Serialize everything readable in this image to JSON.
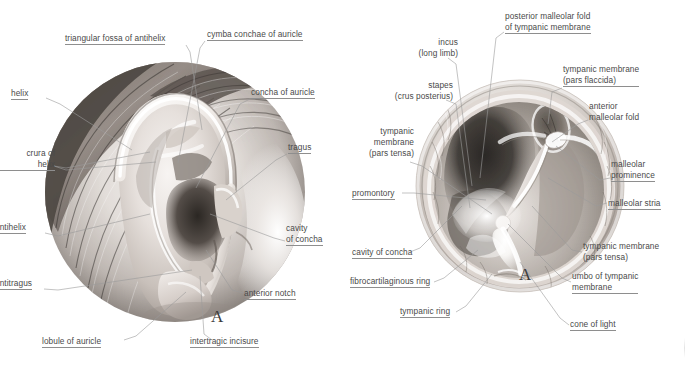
{
  "plate": {
    "background": "#ffffff",
    "label_color": "#4a4a4a",
    "leader_color": "#9a9a9a",
    "width": 688,
    "height": 367
  },
  "panel_a_left": {
    "letter": "A",
    "subject": "auricle-external-ear",
    "labels": [
      {
        "id": "triangular-fossa-of-antihelix",
        "lines": [
          "triangular fossa of antihelix"
        ],
        "x": 65,
        "y": 33,
        "align": "left"
      },
      {
        "id": "cymba-conchae-of-auricle",
        "lines": [
          "cymba conchae of auricle"
        ],
        "x": 207,
        "y": 29,
        "align": "left"
      },
      {
        "id": "helix",
        "lines": [
          "helix"
        ],
        "x": 11,
        "y": 88,
        "align": "left"
      },
      {
        "id": "concha-of-auricle",
        "lines": [
          "concha of auricle"
        ],
        "x": 251,
        "y": 87,
        "align": "left"
      },
      {
        "id": "crura-of-helix",
        "lines": [
          "crura of",
          "helix"
        ],
        "x": -3,
        "y": 148,
        "align": "right",
        "clipped": true
      },
      {
        "id": "tragus",
        "lines": [
          "tragus"
        ],
        "x": 288,
        "y": 142,
        "align": "left"
      },
      {
        "id": "antihelix",
        "lines": [
          "antihelix"
        ],
        "x": -5,
        "y": 222,
        "align": "left",
        "clipped": true
      },
      {
        "id": "cavity-of-concha",
        "lines": [
          "cavity",
          "of concha"
        ],
        "x": 286,
        "y": 223,
        "align": "left"
      },
      {
        "id": "antitragus",
        "lines": [
          "antitragus"
        ],
        "x": -5,
        "y": 278,
        "align": "left",
        "clipped": true
      },
      {
        "id": "anterior-notch",
        "lines": [
          "anterior notch"
        ],
        "x": 244,
        "y": 288,
        "align": "left"
      },
      {
        "id": "lobule-of-auricle",
        "lines": [
          "lobule of auricle"
        ],
        "x": 42,
        "y": 336,
        "align": "left"
      },
      {
        "id": "intertragic-incisure",
        "lines": [
          "intertragic incisure"
        ],
        "x": 190,
        "y": 336,
        "align": "left"
      }
    ]
  },
  "panel_a_right": {
    "letter": "A",
    "subject": "tympanic-membrane-otoscopic-view",
    "labels": [
      {
        "id": "posterior-malleolar-fold-of-tympanic-membrane",
        "lines": [
          "posterior malleolar fold",
          "of tympanic membrane"
        ],
        "x": 505,
        "y": 11,
        "align": "left"
      },
      {
        "id": "incus-long-limb",
        "lines": [
          "incus",
          "(long limb)"
        ],
        "x": 415,
        "y": 37,
        "align": "right"
      },
      {
        "id": "tympanic-membrane-pars-flaccida",
        "lines": [
          "tympanic membrane",
          "(pars flaccida)",
          "..."
        ],
        "x": 563,
        "y": 65,
        "align": "left"
      },
      {
        "id": "stapes-crus-posterius",
        "lines": [
          "stapes",
          "(crus posterius)"
        ],
        "x": 398,
        "y": 80,
        "align": "right"
      },
      {
        "id": "anterior-malleolar-fold",
        "lines": [
          "anterior",
          "malleolar fold"
        ],
        "x": 589,
        "y": 101,
        "align": "left"
      },
      {
        "id": "tympanic-membrane-pars-tensa-left",
        "lines": [
          "tympanic",
          "membrane",
          "(pars tensa)"
        ],
        "x": 356,
        "y": 131,
        "align": "right"
      },
      {
        "id": "malleolar-prominence",
        "lines": [
          "malleolar",
          "prominence"
        ],
        "x": 611,
        "y": 159,
        "align": "left"
      },
      {
        "id": "promontory",
        "lines": [
          "promontory"
        ],
        "x": 352,
        "y": 189,
        "align": "left"
      },
      {
        "id": "malleolar-stria",
        "lines": [
          "malleolar stria"
        ],
        "x": 608,
        "y": 199,
        "align": "left"
      },
      {
        "id": "tympanic-membrane-pars-tensa-right",
        "lines": [
          "tympanic membrane",
          "(pars tensa)"
        ],
        "x": 583,
        "y": 241,
        "align": "left"
      },
      {
        "id": "cavity-of-concha-right",
        "lines": [
          "cavity of concha"
        ],
        "x": 352,
        "y": 248,
        "align": "left"
      },
      {
        "id": "umbo-of-tympanic-membrane",
        "lines": [
          "umbo of tympanic",
          "membrane"
        ],
        "x": 572,
        "y": 272,
        "align": "left"
      },
      {
        "id": "fibrocartilaginous-ring",
        "lines": [
          "fibrocartilaginous ring"
        ],
        "x": 350,
        "y": 277,
        "align": "left"
      },
      {
        "id": "tympanic-ring",
        "lines": [
          "tympanic ring"
        ],
        "x": 400,
        "y": 307,
        "align": "left"
      },
      {
        "id": "cone-of-light",
        "lines": [
          "cone of light",
          "..."
        ],
        "x": 570,
        "y": 320,
        "align": "left"
      }
    ]
  },
  "flaccida_label": {
    "l1": "tympanic membrane",
    "l2": "(pars flaccida)"
  },
  "cone_label": {
    "l1": "cone of light"
  }
}
